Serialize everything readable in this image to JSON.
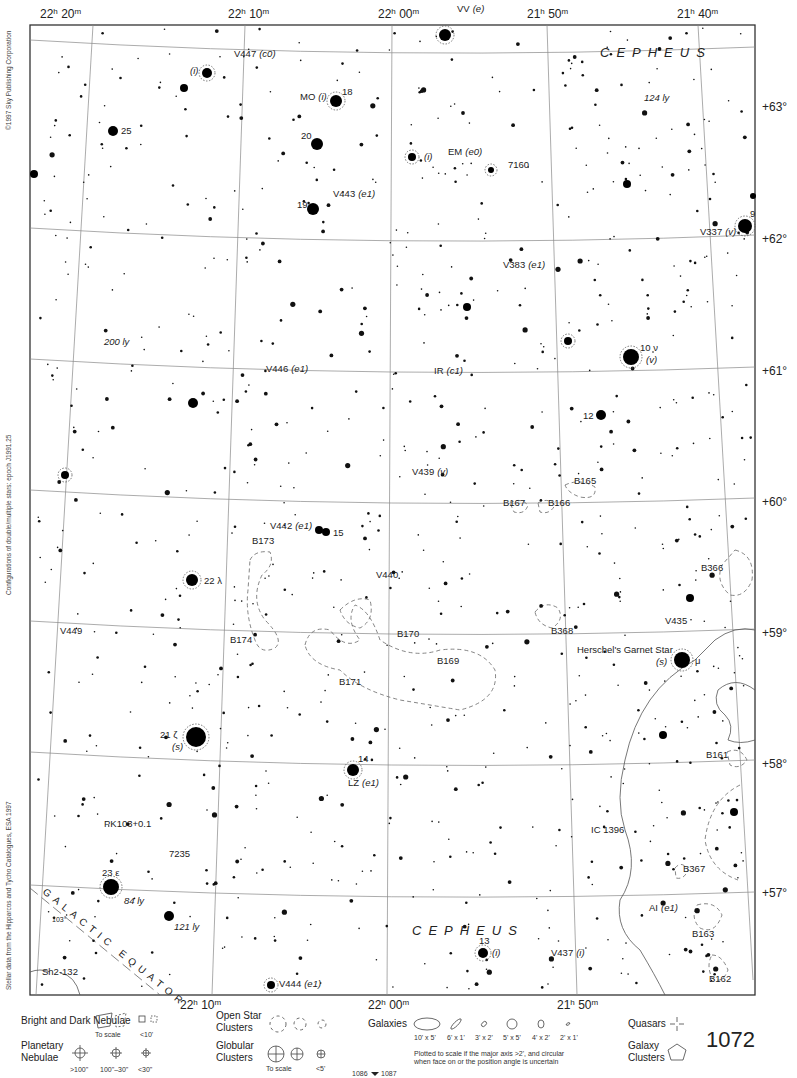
{
  "page_number": "1072",
  "adjacent_pages": {
    "left": "1086",
    "right": "1087"
  },
  "constellation_labels": [
    {
      "text": "CEPHEUS",
      "x": 600,
      "y": 57
    },
    {
      "text": "CEPHEUS",
      "x": 412,
      "y": 935
    }
  ],
  "side_notes": {
    "copyright": "©1997 Sky Publishing Corporation",
    "configurations": "Configurations of double/multiple stars: epoch J1991.25",
    "stellar_data": "Stellar data from the Hipparcos and Tycho Catalogues, ESA 1997"
  },
  "ra_top": [
    {
      "h": "22",
      "m": "20",
      "x": 40
    },
    {
      "h": "22",
      "m": "10",
      "x": 228
    },
    {
      "h": "22",
      "m": "00",
      "x": 378
    },
    {
      "h": "21",
      "m": "50",
      "x": 527
    },
    {
      "h": "21",
      "m": "40",
      "x": 677
    }
  ],
  "ra_bottom": [
    {
      "h": "22",
      "m": "10",
      "x": 180
    },
    {
      "h": "22",
      "m": "00",
      "x": 368
    },
    {
      "h": "21",
      "m": "50",
      "x": 557
    }
  ],
  "dec_labels": [
    {
      "text": "+63°",
      "y": 107
    },
    {
      "text": "+62°",
      "y": 239
    },
    {
      "text": "+61°",
      "y": 371
    },
    {
      "text": "+60°",
      "y": 502
    },
    {
      "text": "+59°",
      "y": 633
    },
    {
      "text": "+58°",
      "y": 764
    },
    {
      "text": "+57°",
      "y": 893
    }
  ],
  "labels": [
    {
      "text": "VV",
      "it": "(e)",
      "x": 457,
      "y": 12
    },
    {
      "text": "V447",
      "it": "(c0)",
      "x": 234,
      "y": 57
    },
    {
      "text": "",
      "it": "(i)",
      "x": 190,
      "y": 74
    },
    {
      "text": "MO",
      "it": "(i)",
      "x": 300,
      "y": 100
    },
    {
      "text": "18",
      "it": "",
      "x": 342,
      "y": 95
    },
    {
      "text": "124 ly",
      "it": "",
      "x": 644,
      "y": 101,
      "italic": true
    },
    {
      "text": "25",
      "it": "",
      "x": 121,
      "y": 134
    },
    {
      "text": "20",
      "it": "",
      "x": 301,
      "y": 139
    },
    {
      "text": "",
      "it": "(i)",
      "x": 424,
      "y": 160
    },
    {
      "text": "EM",
      "it": "(e0)",
      "x": 448,
      "y": 155
    },
    {
      "text": "7160",
      "it": "",
      "x": 508,
      "y": 168
    },
    {
      "text": "V443",
      "it": "(e1)",
      "x": 333,
      "y": 197
    },
    {
      "text": "19",
      "it": "",
      "x": 297,
      "y": 208
    },
    {
      "text": "V337",
      "it": "(v)",
      "x": 700,
      "y": 235
    },
    {
      "text": "9",
      "it": "",
      "x": 750,
      "y": 217
    },
    {
      "text": "V383",
      "it": "(e1)",
      "x": 503,
      "y": 268
    },
    {
      "text": "200 ly",
      "it": "",
      "x": 104,
      "y": 345,
      "italic": true
    },
    {
      "text": "10 ν",
      "it": "",
      "x": 640,
      "y": 351
    },
    {
      "text": "",
      "it": "(v)",
      "x": 646,
      "y": 363
    },
    {
      "text": "V446",
      "it": "(e1)",
      "x": 266,
      "y": 372
    },
    {
      "text": "IR",
      "it": "(c1)",
      "x": 434,
      "y": 374
    },
    {
      "text": "12",
      "it": "",
      "x": 583,
      "y": 419
    },
    {
      "text": "V439",
      "it": "(v)",
      "x": 412,
      "y": 475
    },
    {
      "text": "B165",
      "it": "",
      "x": 574,
      "y": 484
    },
    {
      "text": "B167",
      "it": "",
      "x": 503,
      "y": 506
    },
    {
      "text": "B166",
      "it": "",
      "x": 548,
      "y": 506
    },
    {
      "text": "V442",
      "it": "(e1)",
      "x": 270,
      "y": 529
    },
    {
      "text": "15",
      "it": "",
      "x": 333,
      "y": 536
    },
    {
      "text": "B173",
      "it": "",
      "x": 252,
      "y": 544
    },
    {
      "text": "V440",
      "it": "",
      "x": 376,
      "y": 578
    },
    {
      "text": "22 λ",
      "it": "",
      "x": 204,
      "y": 584
    },
    {
      "text": "B366",
      "it": "",
      "x": 701,
      "y": 571
    },
    {
      "text": "V435",
      "it": "",
      "x": 665,
      "y": 624
    },
    {
      "text": "V449",
      "it": "",
      "x": 60,
      "y": 634
    },
    {
      "text": "B368",
      "it": "",
      "x": 551,
      "y": 634
    },
    {
      "text": "B170",
      "it": "",
      "x": 397,
      "y": 637
    },
    {
      "text": "B174",
      "it": "",
      "x": 230,
      "y": 643
    },
    {
      "text": "Herschel's Garnet Star",
      "it": "",
      "x": 577,
      "y": 653
    },
    {
      "text": "",
      "it": "(s)",
      "x": 656,
      "y": 665
    },
    {
      "text": "μ",
      "it": "",
      "x": 695,
      "y": 664
    },
    {
      "text": "B169",
      "it": "",
      "x": 437,
      "y": 664
    },
    {
      "text": "B171",
      "it": "",
      "x": 339,
      "y": 685
    },
    {
      "text": "21 ζ",
      "it": "",
      "x": 160,
      "y": 738
    },
    {
      "text": "",
      "it": "(s)",
      "x": 172,
      "y": 750
    },
    {
      "text": "B161",
      "it": "",
      "x": 706,
      "y": 758
    },
    {
      "text": "14",
      "it": "",
      "x": 358,
      "y": 762
    },
    {
      "text": "LZ",
      "it": "(e1)",
      "x": 348,
      "y": 786
    },
    {
      "text": "PK103+0.1",
      "it": "",
      "x": 104,
      "y": 827
    },
    {
      "text": "IC 1396",
      "it": "",
      "x": 591,
      "y": 833
    },
    {
      "text": "7235",
      "it": "",
      "x": 169,
      "y": 857
    },
    {
      "text": "23 ε",
      "it": "",
      "x": 102,
      "y": 876
    },
    {
      "text": "B367",
      "it": "",
      "x": 683,
      "y": 872
    },
    {
      "text": "84 ly",
      "it": "",
      "x": 124,
      "y": 904,
      "italic": true
    },
    {
      "text": "AI",
      "it": "(e1)",
      "x": 649,
      "y": 911
    },
    {
      "text": "121 ly",
      "it": "",
      "x": 174,
      "y": 930,
      "italic": true
    },
    {
      "text": "B163",
      "it": "",
      "x": 692,
      "y": 937
    },
    {
      "text": "13",
      "it": "",
      "x": 479,
      "y": 944
    },
    {
      "text": "",
      "it": "(i)",
      "x": 492,
      "y": 956
    },
    {
      "text": "V437",
      "it": "(i)",
      "x": 551,
      "y": 956
    },
    {
      "text": "B162",
      "it": "",
      "x": 709,
      "y": 982
    },
    {
      "text": "Sh2-132",
      "it": "",
      "x": 42,
      "y": 975
    },
    {
      "text": "V444",
      "it": "(e1)",
      "x": 279,
      "y": 987
    },
    {
      "text": "103°",
      "it": "",
      "x": 52,
      "y": 922,
      "small": true
    }
  ],
  "galactic_equator": {
    "text": "GALACTIC EQUATOR"
  },
  "bright_stars": [
    {
      "x": 445,
      "y": 35,
      "r": 6,
      "ring": true
    },
    {
      "x": 207,
      "y": 73,
      "r": 5,
      "ring": true
    },
    {
      "x": 184,
      "y": 88,
      "r": 4
    },
    {
      "x": 336,
      "y": 101,
      "r": 6,
      "ring": true
    },
    {
      "x": 113,
      "y": 131,
      "r": 5
    },
    {
      "x": 317,
      "y": 144,
      "r": 6
    },
    {
      "x": 412,
      "y": 157,
      "r": 4,
      "ring": true
    },
    {
      "x": 491,
      "y": 170,
      "r": 3,
      "ring": true
    },
    {
      "x": 313,
      "y": 209,
      "r": 6
    },
    {
      "x": 745,
      "y": 226,
      "r": 7,
      "ring": true
    },
    {
      "x": 631,
      "y": 357,
      "r": 8,
      "ring": true
    },
    {
      "x": 601,
      "y": 415,
      "r": 5
    },
    {
      "x": 193,
      "y": 403,
      "r": 5
    },
    {
      "x": 467,
      "y": 307,
      "r": 4
    },
    {
      "x": 568,
      "y": 341,
      "r": 4,
      "ring": true
    },
    {
      "x": 34,
      "y": 174,
      "r": 4
    },
    {
      "x": 65,
      "y": 475,
      "r": 4,
      "ring": true
    },
    {
      "x": 192,
      "y": 580,
      "r": 6,
      "ring": true
    },
    {
      "x": 319,
      "y": 530,
      "r": 4
    },
    {
      "x": 326,
      "y": 532,
      "r": 4
    },
    {
      "x": 682,
      "y": 660,
      "r": 8,
      "ring": true
    },
    {
      "x": 196,
      "y": 737,
      "r": 10,
      "ring": true
    },
    {
      "x": 353,
      "y": 770,
      "r": 6,
      "ring": true
    },
    {
      "x": 111,
      "y": 887,
      "r": 8,
      "ring": true
    },
    {
      "x": 169,
      "y": 916,
      "r": 5
    },
    {
      "x": 483,
      "y": 953,
      "r": 5,
      "ring": true
    },
    {
      "x": 271,
      "y": 985,
      "r": 4,
      "ring": true
    },
    {
      "x": 690,
      "y": 598,
      "r": 4
    },
    {
      "x": 663,
      "y": 735,
      "r": 4
    },
    {
      "x": 734,
      "y": 812,
      "r": 4
    },
    {
      "x": 627,
      "y": 184,
      "r": 4
    },
    {
      "x": 753,
      "y": 196,
      "r": 3
    }
  ],
  "legend": {
    "nebulae_bright_dark": "Bright and Dark Nebulae",
    "nebulae_to_scale": "To scale",
    "nebulae_small": "<10'",
    "planetary": "Planetary Nebulae",
    "planetary_sizes": [
      ">100\"",
      "100\"–30\"",
      "<30\""
    ],
    "open_clusters": "Open Star Clusters",
    "globular_clusters": "Globular Clusters",
    "globular_to_scale": "To scale",
    "globular_small": "<5'",
    "galaxies": "Galaxies",
    "galaxy_sizes": [
      "10' x 5'",
      "6' x 1'",
      "3' x 2'",
      "5' x 5'",
      "4' x 2'",
      "2' x 1'"
    ],
    "galaxy_note_1": "Plotted to scale if the major axis >2', and circular",
    "galaxy_note_2": "when face on or the position angle is uncertain",
    "quasars": "Quasars",
    "galaxy_clusters": "Galaxy Clusters"
  }
}
